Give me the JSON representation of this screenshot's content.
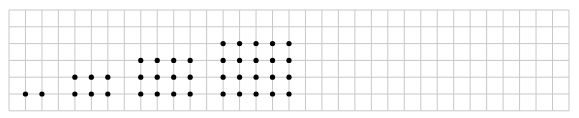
{
  "diagram": {
    "type": "dot-pattern-on-grid",
    "grid": {
      "left": 9,
      "top": 10,
      "cols": 34,
      "rows": 6,
      "cell_w": 16.47,
      "cell_h": 16.8,
      "line_color": "#c8c8c8",
      "dot_color": "#000000",
      "dot_radius": 2.6
    },
    "groups": [
      {
        "label": "1 x 2",
        "rows": 1,
        "cols": 2,
        "start_col": 1,
        "bottom_row": 5
      },
      {
        "label": "2 x 3",
        "rows": 2,
        "cols": 3,
        "start_col": 4,
        "bottom_row": 5
      },
      {
        "label": "3 x 4",
        "rows": 3,
        "cols": 4,
        "start_col": 8,
        "bottom_row": 5
      },
      {
        "label": "4 x 5",
        "rows": 4,
        "cols": 5,
        "start_col": 13,
        "bottom_row": 5
      }
    ]
  }
}
